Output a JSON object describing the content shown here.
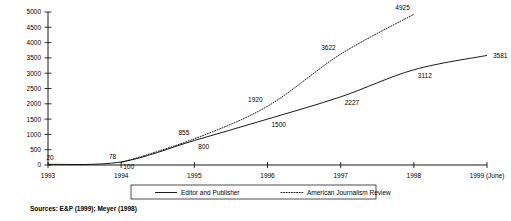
{
  "chart_data": {
    "type": "line",
    "title": "",
    "subtitle": "",
    "xlabel": "",
    "ylabel": "",
    "xlim": [
      1993,
      1999
    ],
    "ylim": [
      0,
      5000
    ],
    "grid": false,
    "legend_position": "bottom",
    "categories": [
      "1993",
      "1994",
      "1995",
      "1996",
      "1997",
      "1998",
      "1999 (June)"
    ],
    "x_tick_labels": [
      "1993",
      "1994",
      "1995",
      "1996",
      "1997",
      "1998",
      "1999 (June)"
    ],
    "y_tick_labels": [
      "0",
      "500",
      "1000",
      "1500",
      "2000",
      "2500",
      "3000",
      "3500",
      "4000",
      "4500",
      "5000"
    ],
    "y_ticks": [
      0,
      500,
      1000,
      1500,
      2000,
      2500,
      3000,
      3500,
      4000,
      4500,
      5000
    ],
    "series": [
      {
        "name": "Editor and Publisher",
        "style": "solid",
        "x": [
          "1993",
          "1994",
          "1995",
          "1996",
          "1997",
          "1998",
          "1999 (June)"
        ],
        "values": [
          20,
          100,
          800,
          1500,
          2227,
          3112,
          3581
        ],
        "data_labels": [
          "20",
          "100",
          "800",
          "1500",
          "2227",
          "3112",
          "3581"
        ]
      },
      {
        "name": "American Journalism Review",
        "style": "dotted",
        "x": [
          "1994",
          "1995",
          "1996",
          "1997",
          "1998"
        ],
        "values": [
          78,
          855,
          1920,
          3622,
          4925
        ],
        "data_labels": [
          "78",
          "855",
          "1920",
          "3622",
          "4925"
        ]
      }
    ],
    "annotations": [
      {
        "text": "Sources: E&P (1999); Meyer (1998)",
        "position": "below-plot-left"
      }
    ]
  },
  "legend": {
    "entries": [
      {
        "label": "Editor and Publisher",
        "style": "solid"
      },
      {
        "label": "American Journalism Review",
        "style": "dotted"
      }
    ]
  },
  "source_note": "Sources: E&P (1999); Meyer (1998)",
  "colors": {
    "line": "#000000",
    "axis": "#000000",
    "background": "#ffffff",
    "text": "#000000"
  }
}
